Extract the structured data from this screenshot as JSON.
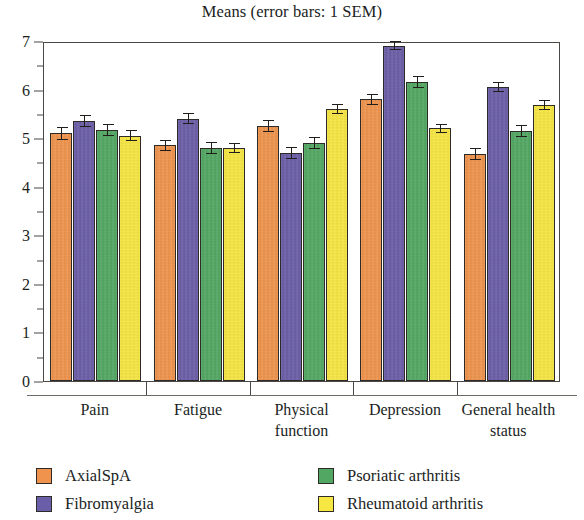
{
  "chart_data": {
    "type": "bar",
    "title": "Means (error bars: 1 SEM)",
    "xlabel": "",
    "ylabel": "",
    "ylim": [
      0,
      7
    ],
    "y_major_step": 1,
    "y_minor_step": 0.5,
    "grid": false,
    "legend_position": "bottom",
    "error_bar_note": "1 SEM",
    "categories": [
      "Pain",
      "Fatigue",
      "Physical function",
      "Depression",
      "General health status"
    ],
    "y_tick_labels": [
      "0",
      "1",
      "2",
      "3",
      "4",
      "5",
      "6",
      "7"
    ],
    "series": [
      {
        "name": "AxialSpA",
        "color": "#F0944D",
        "values": [
          5.1,
          4.85,
          5.25,
          5.8,
          4.68
        ],
        "errors": [
          0.13,
          0.12,
          0.12,
          0.11,
          0.12
        ]
      },
      {
        "name": "Fibromyalgia",
        "color": "#6B5EA8",
        "values": [
          5.35,
          5.4,
          4.7,
          6.9,
          6.05
        ],
        "errors": [
          0.12,
          0.11,
          0.12,
          0.09,
          0.11
        ]
      },
      {
        "name": "Psoriatic arthritis",
        "color": "#52A863",
        "values": [
          5.17,
          4.8,
          4.9,
          6.15,
          5.15
        ],
        "errors": [
          0.13,
          0.12,
          0.13,
          0.12,
          0.13
        ]
      },
      {
        "name": "Rheumatoid arthritis",
        "color": "#F7E742",
        "values": [
          5.05,
          4.8,
          5.6,
          5.2,
          5.68
        ],
        "errors": [
          0.11,
          0.11,
          0.11,
          0.1,
          0.1
        ]
      }
    ]
  },
  "legend": {
    "items": [
      {
        "label": "AxialSpA",
        "color": "#F0944D"
      },
      {
        "label": "Fibromyalgia",
        "color": "#6B5EA8"
      },
      {
        "label": "Psoriatic arthritis",
        "color": "#52A863"
      },
      {
        "label": "Rheumatoid arthritis",
        "color": "#F7E742"
      }
    ]
  }
}
